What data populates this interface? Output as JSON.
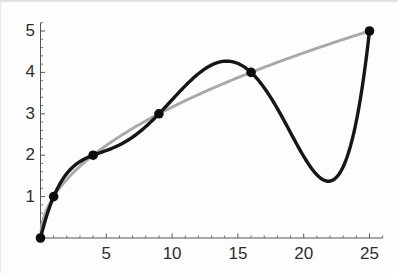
{
  "figure": {
    "background": "#fdfdfd"
  },
  "chart_data": {
    "type": "line",
    "title": "",
    "xlabel": "",
    "ylabel": "",
    "xlim": [
      0,
      25
    ],
    "ylim": [
      0,
      5
    ],
    "grid": false,
    "legend": null,
    "axes": {
      "color": "#555555",
      "tick_label_color": "#2e2e2e",
      "tick_label_size": 17,
      "x_major_ticks": [
        5,
        10,
        15,
        20,
        25
      ],
      "x_minor_step": 1,
      "x_overhang": 1.0,
      "y_major_ticks": [
        1,
        2,
        3,
        4,
        5
      ],
      "y_minor_step": 0.2,
      "y_overhang": 0.2,
      "major_tick_len": 4.5,
      "minor_tick_len": 2.6
    },
    "points": {
      "label": "interpolation-nodes",
      "color": "#0d0d0d",
      "radius": 4.8,
      "xy": [
        [
          0,
          0
        ],
        [
          1,
          1
        ],
        [
          4,
          2
        ],
        [
          9,
          3
        ],
        [
          16,
          4
        ],
        [
          25,
          5
        ]
      ]
    },
    "series": [
      {
        "name": "sqrt(x)",
        "type": "power",
        "power": 0.5,
        "coefficient": 1,
        "color": "#a9a9a9",
        "stroke_width": 2.9,
        "domain": [
          0,
          25
        ],
        "samples": 260
      },
      {
        "name": "degree-5 interpolating polynomial",
        "type": "polynomial",
        "coefficients": [
          0,
          1.291269841,
          -0.330246914,
          0.041087963,
          -0.002149471,
          3.85802e-05
        ],
        "color": "#161616",
        "stroke_width": 3.4,
        "domain": [
          0,
          25
        ],
        "samples": 260
      }
    ],
    "plot_area_px": {
      "x0": 40.5,
      "y0": 238,
      "x1": 369.5,
      "y1": 31
    },
    "x_label_baseline_offset": 21,
    "y_label_right_x": 35,
    "y_label_baseline_offset": 5
  }
}
